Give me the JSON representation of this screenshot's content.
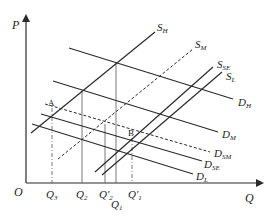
{
  "diagram": {
    "axes": {
      "y_label": "P",
      "x_label": "Q",
      "origin_label": "O"
    },
    "supply_curves": [
      {
        "id": "SH",
        "label": "S",
        "sub": "H",
        "style": "solid"
      },
      {
        "id": "SM",
        "label": "S",
        "sub": "M",
        "style": "dashed"
      },
      {
        "id": "SSE",
        "label": "S",
        "sub": "SE",
        "style": "solid"
      },
      {
        "id": "SL",
        "label": "S",
        "sub": "L",
        "style": "solid"
      }
    ],
    "demand_curves": [
      {
        "id": "DH",
        "label": "D",
        "sub": "H",
        "style": "solid"
      },
      {
        "id": "DM",
        "label": "D",
        "sub": "M",
        "style": "solid"
      },
      {
        "id": "DSM",
        "label": "D",
        "sub": "SM",
        "style": "dashed"
      },
      {
        "id": "DSE",
        "label": "D",
        "sub": "SE",
        "style": "solid"
      },
      {
        "id": "DL",
        "label": "D",
        "sub": "L",
        "style": "solid"
      }
    ],
    "points": [
      {
        "id": "A",
        "label": "A"
      },
      {
        "id": "B",
        "label": "B"
      }
    ],
    "quantity_ticks": [
      {
        "id": "Q3",
        "base": "Q",
        "sub": "3",
        "prime": ""
      },
      {
        "id": "Q2",
        "base": "Q",
        "sub": "2",
        "prime": ""
      },
      {
        "id": "Qp2",
        "base": "Q",
        "sub": "2",
        "prime": "'"
      },
      {
        "id": "Q1",
        "base": "Q",
        "sub": "1",
        "prime": ""
      },
      {
        "id": "Qp1",
        "base": "Q",
        "sub": "1",
        "prime": "'"
      }
    ],
    "colors": {
      "line": "#2a2a2a",
      "guide": "#555555",
      "background": "#ffffff"
    }
  }
}
